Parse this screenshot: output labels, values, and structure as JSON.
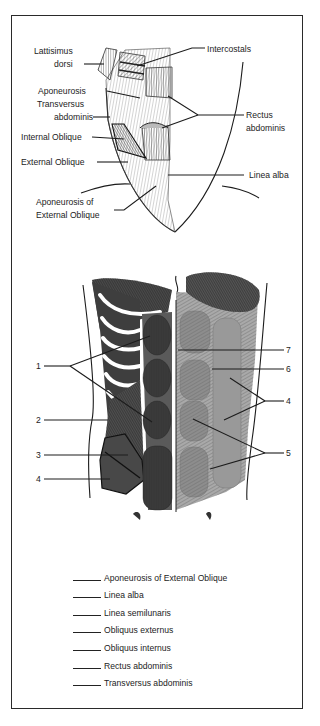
{
  "upper_figure": {
    "labels": [
      {
        "id": "lattisimus-dorsi",
        "lines": [
          "Lattisimus",
          "dorsi"
        ]
      },
      {
        "id": "intercostals",
        "lines": [
          "Intercostals"
        ]
      },
      {
        "id": "aponeurosis-transversus",
        "lines": [
          "Aponeurosis",
          "Transversus",
          "abdominis"
        ]
      },
      {
        "id": "rectus-abdominis",
        "lines": [
          "Rectus",
          "abdominis"
        ]
      },
      {
        "id": "internal-oblique",
        "lines": [
          "Internal Oblique"
        ]
      },
      {
        "id": "external-oblique",
        "lines": [
          "External Oblique"
        ]
      },
      {
        "id": "linea-alba",
        "lines": [
          "Linea alba"
        ]
      },
      {
        "id": "aponeurosis-external-oblique",
        "lines": [
          "Aponeurosis of",
          "External Oblique"
        ]
      }
    ]
  },
  "lower_figure": {
    "left_numbers": [
      "1",
      "2",
      "3",
      "4"
    ],
    "right_numbers": [
      "7",
      "6",
      "4",
      "5"
    ]
  },
  "answer_key": {
    "items": [
      "Aponeurosis of External Oblique",
      "Linea alba",
      "Linea semilunaris",
      "Obliquus externus",
      "Obliquus internus",
      "Rectus abdominis",
      "Transversus abdominis"
    ]
  }
}
